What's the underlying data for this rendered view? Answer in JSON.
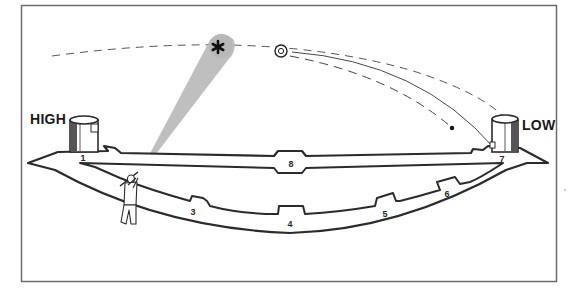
{
  "diagram": {
    "type": "skeet-field-layout",
    "labels": {
      "high_house": "HIGH",
      "low_house": "LOW"
    },
    "stations": [
      {
        "id": "1",
        "x": 83,
        "y": 158
      },
      {
        "id": "3",
        "x": 193,
        "y": 212
      },
      {
        "id": "4",
        "x": 290,
        "y": 224
      },
      {
        "id": "5",
        "x": 385,
        "y": 214
      },
      {
        "id": "6",
        "x": 447,
        "y": 194
      },
      {
        "id": "7",
        "x": 502,
        "y": 159
      },
      {
        "id": "8",
        "x": 291,
        "y": 164
      }
    ],
    "colors": {
      "line": "#2b2b2b",
      "frame": "#6b6b6b",
      "sight_cone": "#b8b8b8",
      "background": "#ffffff"
    },
    "elements": [
      "high-house",
      "low-house",
      "shooter",
      "sight-cone",
      "lead-point-star",
      "clay-target",
      "flight-path",
      "shot-string-path",
      "station-walkway"
    ]
  }
}
